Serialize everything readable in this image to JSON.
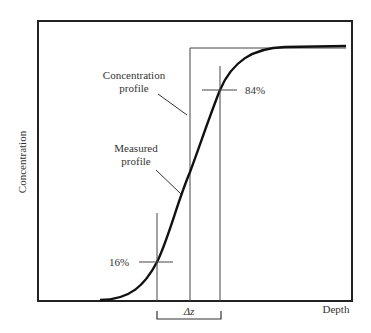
{
  "figure": {
    "y_axis_label": "Concentration",
    "x_axis_label": "Depth",
    "annotations": {
      "concentration_profile": [
        "Concentration",
        "profile"
      ],
      "measured_profile": [
        "Measured",
        "profile"
      ],
      "p84": "84%",
      "p16": "16%",
      "delta_z": "Δz"
    },
    "colors": {
      "frame": "#222222",
      "curve": "#111111",
      "thin_lines": "#444444",
      "text": "#333333"
    }
  }
}
